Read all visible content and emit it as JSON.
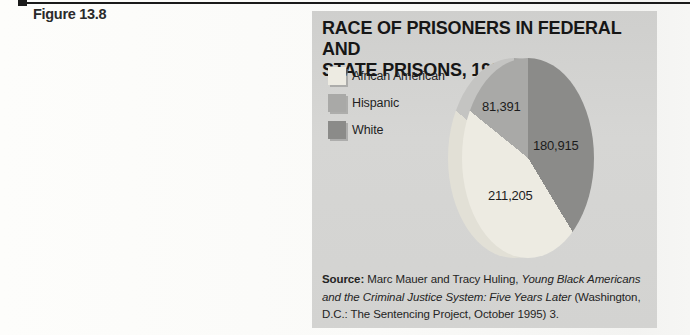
{
  "figure_label": "Figure 13.8",
  "panel": {
    "title_line1": "RACE OF PRISONERS IN FEDERAL AND",
    "title_line2": "STATE PRISONS, 1994"
  },
  "legend": {
    "items": [
      {
        "label": "African American"
      },
      {
        "label": "Hispanic"
      },
      {
        "label": "White"
      }
    ]
  },
  "pie_labels": {
    "hispanic": "81,391",
    "white": "180,915",
    "african_american": "211,205"
  },
  "source": {
    "lines": [
      {
        "segments": [
          {
            "style": "bold",
            "text": "Source:"
          },
          {
            "style": "normal",
            "text": " Marc Mauer and Tracy Huling, "
          },
          {
            "style": "italic",
            "text": "Young Black Americans"
          }
        ]
      },
      {
        "segments": [
          {
            "style": "italic",
            "text": "and the Criminal Justice System: Five Years Later"
          },
          {
            "style": "normal",
            "text": " (Washington,"
          }
        ]
      },
      {
        "segments": [
          {
            "style": "normal",
            "text": "D.C.: The Sentencing Project, October 1995) 3."
          }
        ]
      }
    ]
  },
  "palette": {
    "slice_white": "#8b8b89",
    "slice_african_american": "#edebe2",
    "slice_hispanic": "#a9a9a7",
    "highlight_white": "#a7a7a5",
    "highlight_african_american": "#e2e0d6",
    "highlight_hispanic": "#c4c4c2",
    "panel_gray": "#d4d4d2",
    "rule_black": "#1a1a1a",
    "text_dark": "#1c1c1c"
  },
  "chart_data": {
    "type": "pie",
    "title": "RACE OF PRISONERS IN FEDERAL AND STATE PRISONS, 1994",
    "categories": [
      "White",
      "African American",
      "Hispanic"
    ],
    "values": [
      180915,
      211205,
      81391
    ],
    "value_labels": [
      "180,915",
      "211,205",
      "81,391"
    ],
    "legend_position": "left",
    "start_angle_deg": 0,
    "direction": "clockwise",
    "ellipse_aspect_rx_over_ry": 0.66
  }
}
